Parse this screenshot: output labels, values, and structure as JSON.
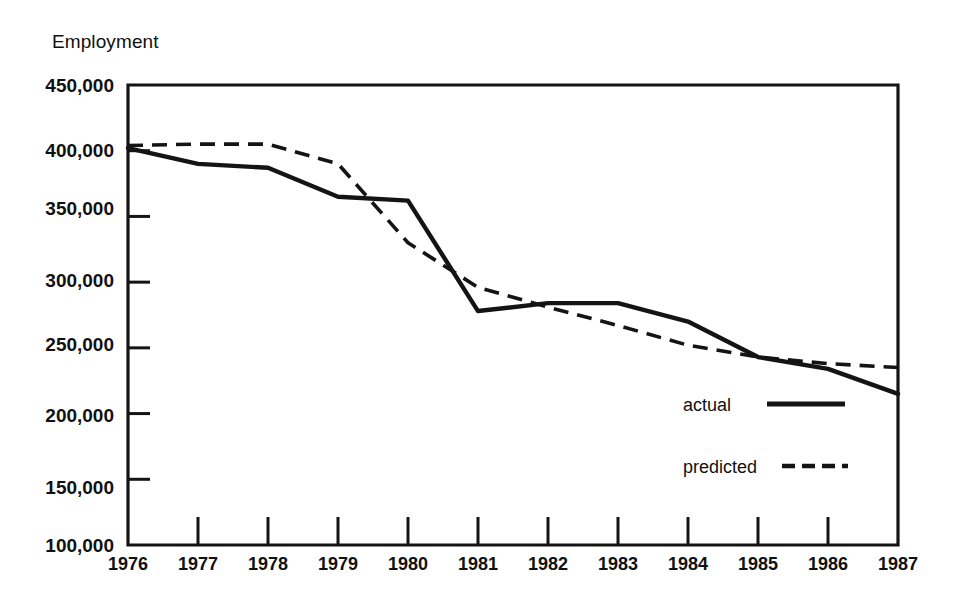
{
  "chart_data": {
    "type": "line",
    "title": "",
    "ylabel": "Employment",
    "xlabel": "",
    "ylim": [
      100000,
      450000
    ],
    "xlim": [
      1976,
      1987
    ],
    "grid": false,
    "legend_position": "inside-bottom-right",
    "ytick_labels": [
      "450,000",
      "400,000",
      "350,000",
      "300,000",
      "250,000",
      "200,000",
      "150,000",
      "100,000"
    ],
    "ytick_values": [
      450000,
      400000,
      350000,
      300000,
      250000,
      200000,
      150000,
      100000
    ],
    "categories": [
      "1976",
      "1977",
      "1978",
      "1979",
      "1980",
      "1981",
      "1982",
      "1983",
      "1984",
      "1985",
      "1986",
      "1987"
    ],
    "x": [
      1976,
      1977,
      1978,
      1979,
      1980,
      1981,
      1982,
      1983,
      1984,
      1985,
      1986,
      1987
    ],
    "series": [
      {
        "name": "actual",
        "style": "solid",
        "color": "#141414",
        "values": [
          402000,
          390000,
          387000,
          365000,
          362000,
          278000,
          284000,
          284000,
          270000,
          243000,
          234000,
          215000
        ]
      },
      {
        "name": "predicted",
        "style": "dashed",
        "color": "#141414",
        "values": [
          404000,
          405000,
          405000,
          390000,
          330000,
          296000,
          281000,
          267000,
          252000,
          243000,
          238000,
          235000
        ]
      }
    ]
  },
  "legend": {
    "items": [
      {
        "label": "actual",
        "style": "solid"
      },
      {
        "label": "predicted",
        "style": "dashed"
      }
    ]
  }
}
